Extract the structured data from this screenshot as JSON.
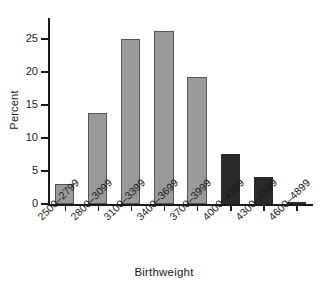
{
  "chart_data": {
    "type": "bar",
    "title": "",
    "xlabel": "Birthweight",
    "ylabel": "Percent",
    "categories": [
      "2500–2799",
      "2800–3099",
      "3100–3399",
      "3400–3699",
      "3700–3999",
      "4000–4399",
      "4300–4599",
      "4600–4899"
    ],
    "values": [
      3.0,
      13.8,
      25.0,
      26.3,
      19.3,
      7.6,
      4.1,
      0.3
    ],
    "bar_colors": [
      "#9a9a9a",
      "#9a9a9a",
      "#9a9a9a",
      "#9a9a9a",
      "#9a9a9a",
      "#2a2a2a",
      "#2a2a2a",
      "#2a2a2a"
    ],
    "bar_edge_color": "#555555",
    "ylim": [
      0,
      28.2
    ],
    "xlim_note": "categorical",
    "yticks": [
      0,
      5,
      10,
      15,
      20,
      25
    ],
    "ytick_labels": [
      "0",
      "5",
      "10",
      "15",
      "20",
      "25"
    ],
    "grid": false,
    "legend": null,
    "axis_color": "#1a1a1a",
    "background": "#ffffff"
  },
  "axes": {
    "y_title": "Percent",
    "x_title": "Birthweight"
  }
}
